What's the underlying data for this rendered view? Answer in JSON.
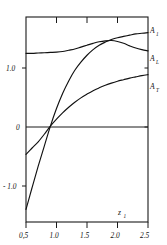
{
  "figure": {
    "background_color": "#ffffff",
    "line_color": "#111111",
    "width": 167,
    "height": 245
  },
  "chart_data": {
    "type": "line",
    "title": "",
    "subtitle": "",
    "xlabel": "z",
    "xlabel_sub": "1",
    "ylabel": "",
    "xlim": [
      0.5,
      2.5
    ],
    "ylim": [
      -1.55,
      1.72
    ],
    "grid": false,
    "legend_position": "right-inline-labels",
    "xticks": [
      0.5,
      1.0,
      1.5,
      2.0,
      2.5
    ],
    "xtick_labels": [
      "0,5",
      "1.0",
      "1.5",
      "2.0",
      "2.5"
    ],
    "yticks": [
      1.0,
      0.0,
      -1.0
    ],
    "ytick_labels": [
      "1.0",
      "0",
      "- 1.0"
    ],
    "annotations": [
      {
        "text": "A",
        "sub": "1",
        "x": 2.5,
        "y": 1.47
      },
      {
        "text": "A",
        "sub": "L",
        "x": 2.5,
        "y": 1.17
      },
      {
        "text": "A",
        "sub": "T",
        "x": 2.5,
        "y": 0.7
      }
    ],
    "reference_lines": [
      {
        "orientation": "horizontal",
        "value": 0.0
      }
    ],
    "series": [
      {
        "name": "A_1",
        "label": "A₁",
        "x": [
          0.5,
          0.6,
          0.7,
          0.8,
          0.9,
          1.0,
          1.1,
          1.2,
          1.3,
          1.4,
          1.5,
          1.6,
          1.7,
          1.8,
          1.9,
          2.0,
          2.1,
          2.2,
          2.3,
          2.4,
          2.5
        ],
        "y": [
          -1.35,
          -1.0,
          -0.66,
          -0.34,
          -0.02,
          0.26,
          0.5,
          0.7,
          0.87,
          1.0,
          1.11,
          1.2,
          1.27,
          1.32,
          1.36,
          1.39,
          1.41,
          1.43,
          1.45,
          1.46,
          1.47
        ]
      },
      {
        "name": "A_L",
        "label": "A_L",
        "x": [
          0.5,
          0.6,
          0.7,
          0.8,
          0.9,
          1.0,
          1.1,
          1.2,
          1.3,
          1.4,
          1.5,
          1.6,
          1.7,
          1.8,
          1.9,
          2.0,
          2.1,
          2.2,
          2.3,
          2.4,
          2.5
        ],
        "y": [
          1.14,
          1.14,
          1.145,
          1.15,
          1.155,
          1.16,
          1.17,
          1.19,
          1.21,
          1.24,
          1.27,
          1.3,
          1.325,
          1.34,
          1.345,
          1.33,
          1.3,
          1.26,
          1.225,
          1.2,
          1.18
        ]
      },
      {
        "name": "A_T",
        "label": "A_T",
        "x": [
          0.5,
          0.6,
          0.7,
          0.8,
          0.9,
          1.0,
          1.1,
          1.2,
          1.3,
          1.4,
          1.5,
          1.6,
          1.7,
          1.8,
          1.9,
          2.0,
          2.1,
          2.2,
          2.3,
          2.4,
          2.5
        ],
        "y": [
          -0.47,
          -0.37,
          -0.27,
          -0.15,
          -0.02,
          0.09,
          0.19,
          0.28,
          0.36,
          0.43,
          0.49,
          0.545,
          0.59,
          0.63,
          0.665,
          0.695,
          0.72,
          0.745,
          0.765,
          0.785,
          0.8
        ]
      }
    ]
  }
}
